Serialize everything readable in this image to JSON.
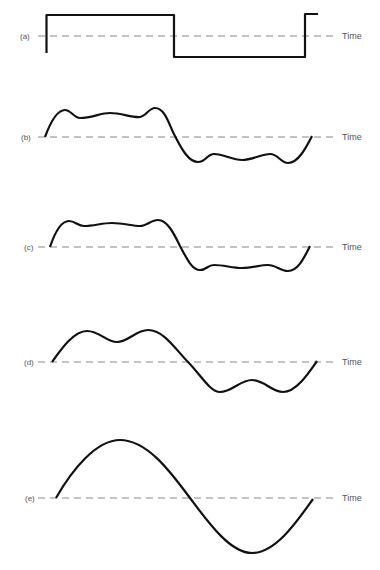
{
  "figure": {
    "axis_label": "Time",
    "panels": [
      {
        "id": "a",
        "label": "(a)",
        "baseline_y": 36,
        "description": "square wave",
        "path": "M46.5 53 L46.5 15 L174 15 L174 57 L305 57 L305 14 L318 14"
      },
      {
        "id": "b",
        "label": "(b)",
        "baseline_y": 137,
        "description": "square wave approximation with many harmonics",
        "path": "M45 137 C52 118 58 110 65 110 C71 110 74 118 80 118 C92 118 100 113 110 113 C122 113 132 118 140 117 C146 116 149 108 155 108 C166 108 170 128 175 136 C182 150 189 162 198 162 C206 162 207 154 214 154 C224 154 232 160 242 160 C252 160 262 154 270 154 C278 154 281 163 288 163 C298 163 306 148 312 136"
      },
      {
        "id": "c",
        "label": "(c)",
        "baseline_y": 247,
        "description": "square wave approximation with fewer harmonics",
        "path": "M50 247 C55 232 61 221 69 221 C75 221 78 226 84 226 C94 226 102 223 112 223 C124 223 132 226 140 226 C147 226 151 220 158 220 C168 220 175 236 180 246 C187 259 192 270 200 270 C207 270 207 265 214 265 C224 265 232 268 242 268 C252 268 260 265 268 265 C276 265 280 271 288 271 C298 271 304 258 310 246"
      },
      {
        "id": "d",
        "label": "(d)",
        "baseline_y": 362,
        "description": "fundamental plus third harmonic",
        "path": "M52 362 C62 348 74 331 87 331 C100 331 106 342 117 342 C128 342 136 330 148 330 C164 330 176 350 188 362 C200 374 210 392 220 392 C232 392 240 380 252 380 C264 380 272 392 283 392 C296 392 308 374 317 361"
      },
      {
        "id": "e",
        "label": "(e)",
        "baseline_y": 498,
        "description": "fundamental sine wave",
        "path": "M56 498 C72 470 96 440 120 440 C148 440 172 474 190 498 C208 522 230 553 252 553 C276 553 298 520 313 499"
      }
    ],
    "baseline_start_x": 38,
    "baseline_end_x": 334,
    "label_x": 24,
    "axis_label_x": 342
  }
}
